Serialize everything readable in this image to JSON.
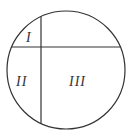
{
  "diagram": {
    "type": "circle-partition",
    "stroke_color": "#333333",
    "background": "#ffffff",
    "circle": {
      "cx": 66,
      "cy": 70,
      "r": 59
    },
    "vertical_line": {
      "x": 41
    },
    "horizontal_line": {
      "y": 47
    },
    "regions": [
      {
        "id": "I",
        "label": "I",
        "x": 29,
        "y": 41
      },
      {
        "id": "II",
        "label": "II",
        "x": 23,
        "y": 85
      },
      {
        "id": "III",
        "label": "III",
        "x": 79,
        "y": 85
      }
    ]
  }
}
